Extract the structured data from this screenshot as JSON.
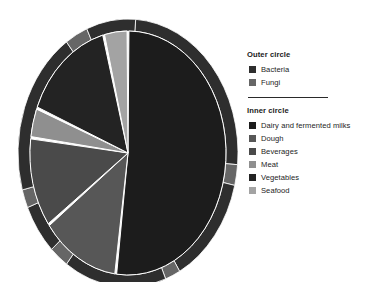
{
  "figure": {
    "background": "#ffffff",
    "kind": "nested-pie"
  },
  "legend": {
    "outer": {
      "title": "Outer circle",
      "items": [
        {
          "label": "Bacteria",
          "color": "#2e2e2e"
        },
        {
          "label": "Fungi",
          "color": "#666666"
        }
      ]
    },
    "inner": {
      "title": "Inner circle",
      "items": [
        {
          "label": "Dairy and fermented milks",
          "color": "#1c1c1c"
        },
        {
          "label": "Dough",
          "color": "#575757"
        },
        {
          "label": "Beverages",
          "color": "#4a4a4a"
        },
        {
          "label": "Meat",
          "color": "#8f8f8f"
        },
        {
          "label": "Vegetables",
          "color": "#232323"
        },
        {
          "label": "Seafood",
          "color": "#a3a3a3"
        }
      ]
    }
  },
  "chart_data": {
    "type": "pie",
    "title": "",
    "subtitle": "",
    "xlabel": "",
    "ylabel": "",
    "grid": false,
    "legend_position": "right",
    "rings": [
      {
        "name": "Outer circle",
        "role": "outer-ring",
        "start_angle_deg": 0,
        "direction": "clockwise",
        "slices": [
          {
            "label": "Bacteria",
            "value": 88,
            "color": "#2e2e2e"
          },
          {
            "label": "Fungi",
            "value": 12,
            "color": "#666666"
          }
        ]
      },
      {
        "name": "Inner circle",
        "role": "inner-pie",
        "start_angle_deg": 0,
        "direction": "clockwise",
        "slices": [
          {
            "label": "Dairy and fermented milks",
            "value": 52,
            "color": "#1c1c1c"
          },
          {
            "label": "Dough",
            "value": 13,
            "color": "#575757"
          },
          {
            "label": "Beverages",
            "value": 12,
            "color": "#4a4a4a"
          },
          {
            "label": "Meat",
            "value": 4,
            "color": "#8f8f8f"
          },
          {
            "label": "Vegetables",
            "value": 15,
            "color": "#232323"
          },
          {
            "label": "Seafood",
            "value": 4,
            "color": "#a3a3a3"
          }
        ]
      }
    ]
  },
  "geometry": {
    "cx": 114,
    "cy": 145,
    "rx_outer": 110,
    "ry_outer": 134,
    "ring_thickness": 12,
    "gap_deg": 1.1
  }
}
